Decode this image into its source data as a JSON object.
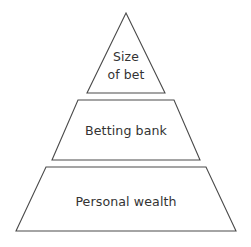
{
  "diagram": {
    "type": "pyramid",
    "orientation": "apex-up",
    "background_color": "#ffffff",
    "stroke_color": "#4a4a4a",
    "fill_color": "#ffffff",
    "text_color": "#333333",
    "tier_count": 3,
    "tiers": [
      {
        "id": "tier-top",
        "level": 1,
        "position": "top",
        "shape": "triangle",
        "label": "Size of bet",
        "label_lines": [
          "Size",
          "of bet"
        ],
        "line_count": 2,
        "points": "126,13 165,93 87,93",
        "label_x": 126,
        "label_line1_y": 61,
        "label_line2_y": 79
      },
      {
        "id": "tier-middle",
        "level": 2,
        "position": "middle",
        "shape": "trapezoid",
        "label": "Betting bank",
        "label_lines": [
          "Betting bank"
        ],
        "line_count": 1,
        "points": "78,100 174,100 200,160 52,160",
        "label_x": 126,
        "label_line1_y": 135,
        "label_line2_y": 0
      },
      {
        "id": "tier-bottom",
        "level": 3,
        "position": "bottom",
        "shape": "trapezoid",
        "label": "Personal wealth",
        "label_lines": [
          "Personal wealth"
        ],
        "line_count": 1,
        "points": "46,167 206,167 236,231 16,231",
        "label_x": 126,
        "label_line1_y": 206,
        "label_line2_y": 0
      }
    ]
  }
}
